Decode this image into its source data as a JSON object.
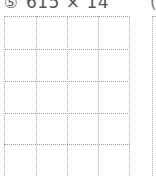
{
  "problem": {
    "number_glyph": "⑤",
    "expression": "615 × 14"
  },
  "next_problem": {
    "partial_glyph": "("
  },
  "grid": {
    "columns": 4,
    "rows_visible": 5,
    "col_positions": [
      0,
      32,
      63,
      94,
      125
    ],
    "row_positions": [
      0,
      33,
      65,
      97,
      128
    ],
    "line_color": "#9a9a9a",
    "line_style": "dotted"
  }
}
